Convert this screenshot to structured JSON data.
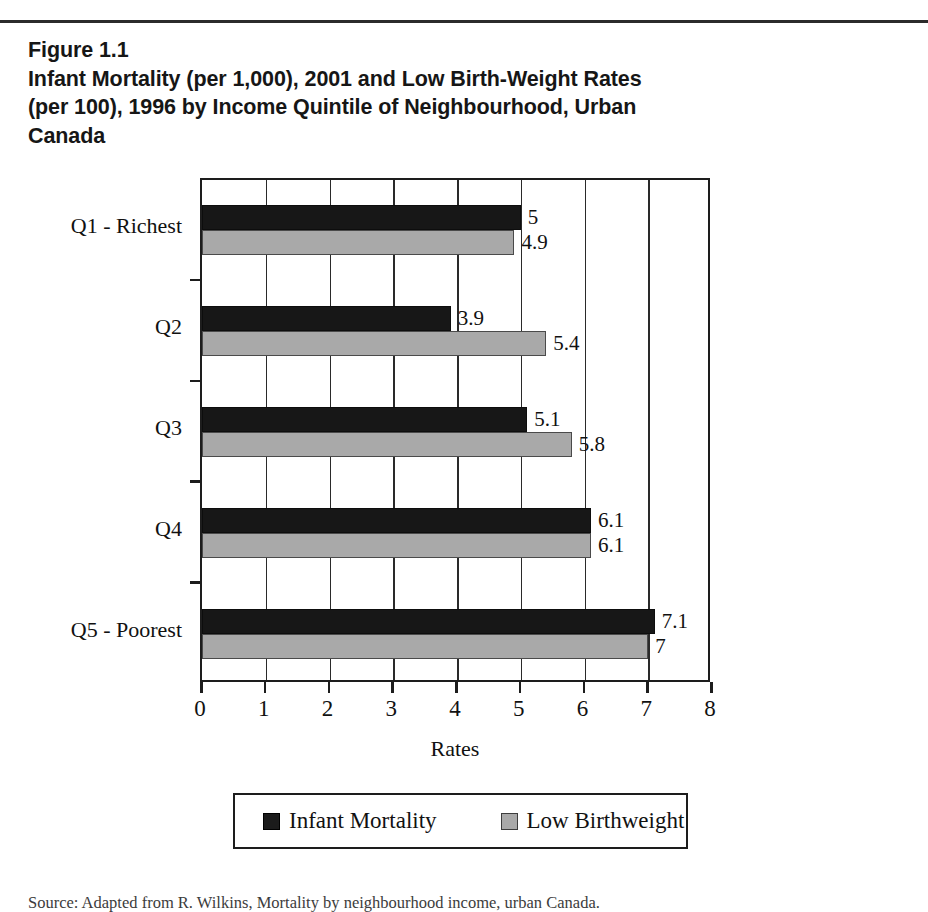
{
  "figure": {
    "number_label": "Figure 1.1",
    "title": "Infant Mortality (per 1,000), 2001 and Low Birth-Weight Rates (per 100), 1996 by Income Quintile of Neighbourhood, Urban Canada",
    "source_note": "Source: Adapted from R. Wilkins, Mortality by neighbourhood income, urban Canada."
  },
  "colors": {
    "infant_mortality": "#171717",
    "low_birthweight": "#a9a9a9",
    "axis": "#1d1d1d",
    "page_background": "#ffffff"
  },
  "chart_data": {
    "type": "bar",
    "orientation": "horizontal",
    "title": "Infant Mortality (per 1,000), 2001 and Low Birth-Weight Rates (per 100), 1996 by Income Quintile of Neighbourhood, Urban Canada",
    "categories": [
      "Q1 - Richest",
      "Q2",
      "Q3",
      "Q4",
      "Q5 - Poorest"
    ],
    "series": [
      {
        "name": "Infant Mortality",
        "color": "#171717",
        "values": [
          5,
          3.9,
          5.1,
          6.1,
          7.1
        ],
        "labels": [
          "5",
          "3.9",
          "5.1",
          "6.1",
          "7.1"
        ]
      },
      {
        "name": "Low Birthweight",
        "color": "#a9a9a9",
        "values": [
          4.9,
          5.4,
          5.8,
          6.1,
          7
        ],
        "labels": [
          "4.9",
          "5.4",
          "5.8",
          "6.1",
          "7"
        ]
      }
    ],
    "xlabel": "Rates",
    "ylabel": "",
    "xlim": [
      0,
      8
    ],
    "xticks": [
      0,
      1,
      2,
      3,
      4,
      5,
      6,
      7,
      8
    ],
    "xticklabels": [
      "0",
      "1",
      "2",
      "3",
      "4",
      "5",
      "6",
      "7",
      "8"
    ],
    "grid": "vertical",
    "legend_position": "below",
    "legend_entries": [
      "Infant Mortality",
      "Low Birthweight"
    ]
  }
}
